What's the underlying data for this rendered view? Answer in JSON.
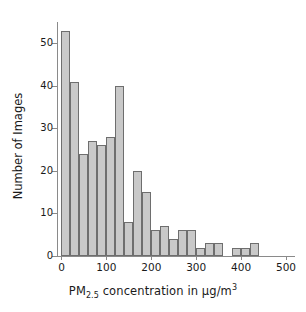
{
  "chart_data": {
    "type": "bar",
    "title": "",
    "subtitle": "",
    "xlabel_parts": {
      "prefix": "PM",
      "subscript": "2.5",
      "middle": " concentration in µg/m",
      "superscript": "3"
    },
    "xlabel": "PM2.5 concentration in µg/m3",
    "ylabel": "Number of Images",
    "xlim": [
      -10,
      520
    ],
    "ylim": [
      0,
      55
    ],
    "grid": false,
    "legend": null,
    "bin_width": 20,
    "xticks": [
      0,
      100,
      200,
      300,
      400,
      500
    ],
    "xtick_labels": [
      "0",
      "100",
      "200",
      "300",
      "400",
      "500"
    ],
    "yticks": [
      0,
      10,
      20,
      30,
      40,
      50
    ],
    "ytick_labels": [
      "0",
      "10",
      "20",
      "30",
      "40",
      "50"
    ],
    "bar_color": "#c9c9c9",
    "bar_edge_color": "#6e6e6e",
    "axis_color": "#8a8a8a",
    "text_color": "#1a1a1a",
    "bins": [
      {
        "x0": 0,
        "x1": 20,
        "center": 10,
        "value": 53
      },
      {
        "x0": 20,
        "x1": 40,
        "center": 30,
        "value": 41
      },
      {
        "x0": 40,
        "x1": 60,
        "center": 50,
        "value": 24
      },
      {
        "x0": 60,
        "x1": 80,
        "center": 70,
        "value": 27
      },
      {
        "x0": 80,
        "x1": 100,
        "center": 90,
        "value": 26
      },
      {
        "x0": 100,
        "x1": 120,
        "center": 110,
        "value": 28
      },
      {
        "x0": 120,
        "x1": 140,
        "center": 130,
        "value": 40
      },
      {
        "x0": 140,
        "x1": 160,
        "center": 150,
        "value": 8
      },
      {
        "x0": 160,
        "x1": 180,
        "center": 170,
        "value": 20
      },
      {
        "x0": 180,
        "x1": 200,
        "center": 190,
        "value": 15
      },
      {
        "x0": 200,
        "x1": 220,
        "center": 210,
        "value": 6
      },
      {
        "x0": 220,
        "x1": 240,
        "center": 230,
        "value": 7
      },
      {
        "x0": 240,
        "x1": 260,
        "center": 250,
        "value": 4
      },
      {
        "x0": 260,
        "x1": 280,
        "center": 270,
        "value": 6
      },
      {
        "x0": 280,
        "x1": 300,
        "center": 290,
        "value": 6
      },
      {
        "x0": 300,
        "x1": 320,
        "center": 310,
        "value": 2
      },
      {
        "x0": 320,
        "x1": 340,
        "center": 330,
        "value": 3
      },
      {
        "x0": 340,
        "x1": 360,
        "center": 350,
        "value": 3
      },
      {
        "x0": 360,
        "x1": 380,
        "center": 370,
        "value": 0
      },
      {
        "x0": 380,
        "x1": 400,
        "center": 390,
        "value": 2
      },
      {
        "x0": 400,
        "x1": 420,
        "center": 410,
        "value": 2
      },
      {
        "x0": 420,
        "x1": 440,
        "center": 430,
        "value": 3
      },
      {
        "x0": 440,
        "x1": 460,
        "center": 450,
        "value": 0
      },
      {
        "x0": 460,
        "x1": 480,
        "center": 470,
        "value": 0
      },
      {
        "x0": 480,
        "x1": 500,
        "center": 490,
        "value": 0
      },
      {
        "x0": 500,
        "x1": 520,
        "center": 510,
        "value": 0
      },
      {
        "x0": 520,
        "x1": 540,
        "center": 530,
        "value": 0
      },
      {
        "x0": 540,
        "x1": 560,
        "center": 550,
        "value": 0
      },
      {
        "x0": 560,
        "x1": 580,
        "center": 570,
        "value": 1
      }
    ],
    "categories": [
      10,
      30,
      50,
      70,
      90,
      110,
      130,
      150,
      170,
      190,
      210,
      230,
      250,
      270,
      290,
      310,
      330,
      350,
      370,
      390,
      410,
      430,
      450,
      470,
      490,
      510,
      530,
      550,
      570
    ],
    "values": [
      53,
      41,
      24,
      27,
      26,
      28,
      40,
      8,
      20,
      15,
      6,
      7,
      4,
      6,
      6,
      2,
      3,
      3,
      0,
      2,
      2,
      3,
      0,
      0,
      0,
      0,
      0,
      0,
      1
    ]
  }
}
